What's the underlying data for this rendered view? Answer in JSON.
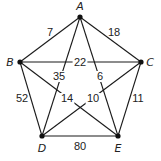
{
  "diagram": {
    "type": "weighted-complete-graph",
    "nodes": [
      {
        "id": "A",
        "label": "A",
        "x": 80,
        "y": 17,
        "lx": 80,
        "ly": 10
      },
      {
        "id": "B",
        "label": "B",
        "x": 20,
        "y": 62,
        "lx": 10,
        "ly": 66
      },
      {
        "id": "C",
        "label": "C",
        "x": 141,
        "y": 62,
        "lx": 150,
        "ly": 66
      },
      {
        "id": "D",
        "label": "D",
        "x": 42,
        "y": 136,
        "lx": 42,
        "ly": 152
      },
      {
        "id": "E",
        "label": "E",
        "x": 118,
        "y": 136,
        "lx": 118,
        "ly": 152
      }
    ],
    "edges": [
      {
        "from": "A",
        "to": "B",
        "weight": "7",
        "wx": 50,
        "wy": 36,
        "bg": false
      },
      {
        "from": "A",
        "to": "C",
        "weight": "18",
        "wx": 114,
        "wy": 36,
        "bg": false
      },
      {
        "from": "B",
        "to": "C",
        "weight": "22",
        "wx": 80,
        "wy": 66,
        "bg": true
      },
      {
        "from": "A",
        "to": "D",
        "weight": "35",
        "wx": 59,
        "wy": 80,
        "bg": true
      },
      {
        "from": "A",
        "to": "E",
        "weight": "6",
        "wx": 100,
        "wy": 80,
        "bg": true
      },
      {
        "from": "B",
        "to": "D",
        "weight": "52",
        "wx": 22,
        "wy": 102,
        "bg": false
      },
      {
        "from": "B",
        "to": "E",
        "weight": "14",
        "wx": 67,
        "wy": 102,
        "bg": true
      },
      {
        "from": "C",
        "to": "D",
        "weight": "10",
        "wx": 93,
        "wy": 102,
        "bg": true
      },
      {
        "from": "C",
        "to": "E",
        "weight": "11",
        "wx": 138,
        "wy": 102,
        "bg": false
      },
      {
        "from": "D",
        "to": "E",
        "weight": "80",
        "wx": 80,
        "wy": 150,
        "bg": false
      }
    ]
  }
}
